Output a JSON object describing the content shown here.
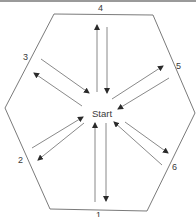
{
  "diagram": {
    "title": "",
    "center_label": "Start",
    "shape": "hexagon",
    "colors": {
      "line": "#6b6b6b",
      "arrow": "#2a2a2a",
      "text": "#3a3a3a"
    },
    "sides": [
      {
        "id": "1",
        "label": "1",
        "position": "bottom"
      },
      {
        "id": "2",
        "label": "2",
        "position": "lower-left"
      },
      {
        "id": "3",
        "label": "3",
        "position": "upper-left"
      },
      {
        "id": "4",
        "label": "4",
        "position": "top"
      },
      {
        "id": "5",
        "label": "5",
        "position": "upper-right"
      },
      {
        "id": "6",
        "label": "6",
        "position": "lower-right"
      }
    ],
    "edges": [
      {
        "from": "Start",
        "to": "1"
      },
      {
        "from": "1",
        "to": "Start"
      },
      {
        "from": "Start",
        "to": "2"
      },
      {
        "from": "2",
        "to": "Start"
      },
      {
        "from": "Start",
        "to": "3"
      },
      {
        "from": "3",
        "to": "Start"
      },
      {
        "from": "Start",
        "to": "4"
      },
      {
        "from": "4",
        "to": "Start"
      },
      {
        "from": "Start",
        "to": "5"
      },
      {
        "from": "5",
        "to": "Start"
      },
      {
        "from": "Start",
        "to": "6"
      },
      {
        "from": "6",
        "to": "Start"
      }
    ]
  }
}
